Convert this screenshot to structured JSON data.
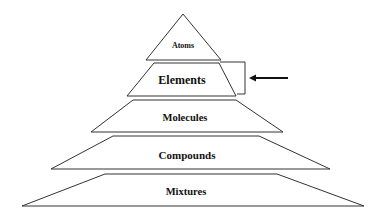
{
  "diagram": {
    "type": "pyramid",
    "levels": [
      {
        "label": "Atoms"
      },
      {
        "label": "Elements",
        "highlighted": true
      },
      {
        "label": "Molecules"
      },
      {
        "label": "Compounds"
      },
      {
        "label": "Mixtures"
      }
    ],
    "annotation": {
      "shape": "bracket-with-left-arrow",
      "points_to": "Elements"
    },
    "colors": {
      "stroke": "#333333",
      "fill": "#ffffff",
      "text": "#111111"
    }
  }
}
